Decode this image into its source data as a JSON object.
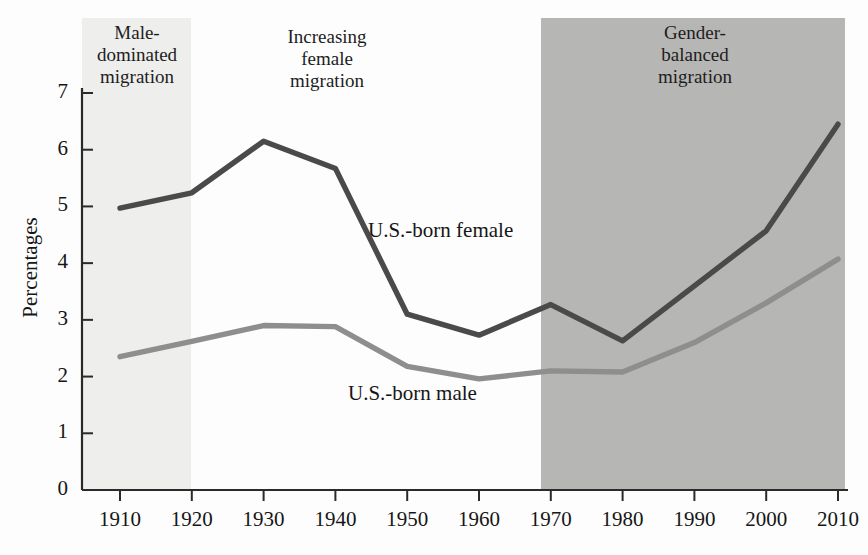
{
  "chart_data": {
    "type": "line",
    "title": "",
    "subtitle": "",
    "xlabel": "",
    "ylabel": "Percentages",
    "x": [
      1910,
      1920,
      1930,
      1940,
      1950,
      1960,
      1970,
      1980,
      1990,
      2000,
      2010
    ],
    "xtick_labels": [
      "1910",
      "1920",
      "1930",
      "1940",
      "1950",
      "1960",
      "1970",
      "1980",
      "1990",
      "2000",
      "2010"
    ],
    "ytick_labels": [
      "0",
      "1",
      "2",
      "3",
      "4",
      "5",
      "6",
      "7"
    ],
    "yticks": [
      0,
      1,
      2,
      3,
      4,
      5,
      6,
      7
    ],
    "ylim": [
      0,
      7
    ],
    "xlim": [
      1910,
      2010
    ],
    "grid": false,
    "legend_position": "inline-annotation",
    "series": [
      {
        "name": "U.S.-born female",
        "color": "#4a4a4a",
        "values": [
          4.97,
          5.24,
          6.15,
          5.67,
          3.1,
          2.73,
          3.27,
          2.63,
          3.6,
          4.57,
          6.45
        ]
      },
      {
        "name": "U.S.-born male",
        "color": "#8e8e8e",
        "values": [
          2.35,
          2.62,
          2.9,
          2.88,
          2.18,
          1.96,
          2.1,
          2.08,
          2.6,
          3.3,
          4.07
        ]
      }
    ],
    "annotations": [
      {
        "name": "male-dominated",
        "text": "Male-\ndominated\nmigration",
        "lines": [
          "Male-",
          "dominated",
          "migration"
        ],
        "x_start": 1910,
        "x_end": 1920,
        "band_color": "#eeeeec"
      },
      {
        "name": "increasing-female",
        "text": "Increasing\nfemale\nmigration",
        "lines": [
          "Increasing",
          "female",
          "migration"
        ],
        "x_start": 1920,
        "x_end": 1970,
        "band_color": "#ffffff"
      },
      {
        "name": "gender-balanced",
        "text": "Gender-\nbalanced\nmigration",
        "lines": [
          "Gender-",
          "balanced",
          "migration"
        ],
        "x_start": 1970,
        "x_end": 2010,
        "band_color": "#b6b6b4"
      }
    ]
  },
  "axes": {
    "y_title": "Percentages",
    "y_ticks": [
      "7",
      "6",
      "5",
      "4",
      "3",
      "2",
      "1",
      "0"
    ],
    "x_ticks": [
      "1910",
      "1920",
      "1930",
      "1940",
      "1950",
      "1960",
      "1970",
      "1980",
      "1990",
      "2000",
      "2010"
    ]
  },
  "bands": {
    "male_dominated": {
      "l1": "Male-",
      "l2": "dominated",
      "l3": "migration"
    },
    "increasing_female": {
      "l1": "Increasing",
      "l2": "female",
      "l3": "migration"
    },
    "gender_balanced": {
      "l1": "Gender-",
      "l2": "balanced",
      "l3": "migration"
    }
  },
  "series_labels": {
    "female": "U.S.-born female",
    "male": "U.S.-born male"
  },
  "colors": {
    "female_line": "#4a4a4a",
    "male_line": "#8e8e8e",
    "band_light": "#eeeeec",
    "band_dark": "#b6b6b4",
    "axis": "#2a2a2a"
  }
}
